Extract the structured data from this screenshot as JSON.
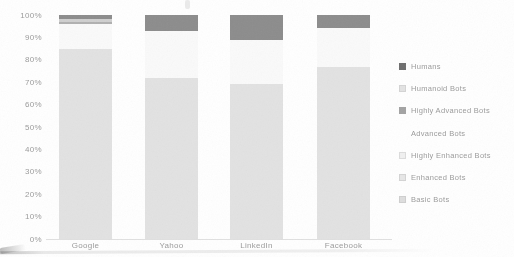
{
  "chart_data": {
    "type": "bar",
    "stacked": true,
    "title": "",
    "categories": [
      "Google",
      "Yahoo",
      "LinkedIn",
      "Facebook"
    ],
    "series": [
      {
        "name": "Humans",
        "color": "#8c8c8c",
        "marker_color": "#6e6e6e",
        "marker_border": "#6e6e6e",
        "values": [
          2,
          7,
          11,
          6
        ]
      },
      {
        "name": "Humanoid Bots",
        "color": "#cfcfcf",
        "marker_color": "#e3e3e3",
        "marker_border": "#d4d4d4",
        "values": [
          1,
          0,
          0,
          0
        ]
      },
      {
        "name": "Highly Advanced Bots",
        "color": "#b0b0b0",
        "marker_color": "#a3a3a3",
        "marker_border": "#a3a3a3",
        "values": [
          1,
          0,
          0,
          0
        ]
      },
      {
        "name": "Advanced Bots",
        "color": "#fafafa",
        "marker_color": "#ffffff",
        "marker_border": "#ffffff",
        "values": [
          11,
          21,
          20,
          17
        ]
      },
      {
        "name": "Highly Enhanced Bots",
        "color": "#f3f3f3",
        "marker_color": "#f0f0f0",
        "marker_border": "#dcdcdc",
        "values": [
          0,
          0,
          0,
          0
        ]
      },
      {
        "name": "Enhanced Bots",
        "color": "#eaeaea",
        "marker_color": "#e7e7e7",
        "marker_border": "#d4d4d4",
        "values": [
          0,
          0,
          0,
          0
        ]
      },
      {
        "name": "Basic Bots",
        "color": "#e2e2e2",
        "marker_color": "#dedede",
        "marker_border": "#cfcfcf",
        "values": [
          85,
          72,
          69,
          77
        ]
      }
    ],
    "y_ticks": [
      "100%",
      "90%",
      "80%",
      "70%",
      "60%",
      "50%",
      "40%",
      "30%",
      "20%",
      "10%",
      "0%"
    ],
    "ylim": [
      0,
      100
    ],
    "grid": false,
    "legend_position": "right"
  }
}
